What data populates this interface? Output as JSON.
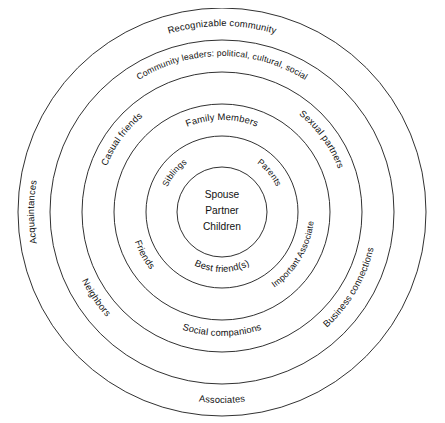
{
  "page": {
    "header_left": "",
    "header_right": "",
    "background": "#ffffff",
    "stroke_color": "#1a1a1a"
  },
  "diagram": {
    "type": "concentric-circles",
    "center": {
      "cx": 222,
      "cy": 204
    },
    "ring_count": 6,
    "radii": [
      204,
      172,
      140,
      108,
      76,
      45
    ],
    "core": {
      "name": "innermost-core",
      "lines": [
        "Spouse",
        "Partner",
        "Children"
      ]
    },
    "labels": {
      "ring1_bottom": "Associates",
      "ring1_left": "Acquaintances",
      "ring2_top": "Recognizable community",
      "ring3_top": "Community leaders: political, cultural, social",
      "ring3_bottom_left": "Neighbors",
      "ring3_bottom_right": "Business connections",
      "ring4_top_left": "Casual friends",
      "ring4_top_right": "Sexual partners",
      "ring4_bottom": "Social companions",
      "ring5_top": "Family Members",
      "ring5_bottom_left": "Friends",
      "ring5_bottom_right": "Important Associate",
      "ring6_top_left": "Siblings",
      "ring6_top_right": "Parents",
      "ring6_bottom": "Best friend(s)"
    }
  }
}
